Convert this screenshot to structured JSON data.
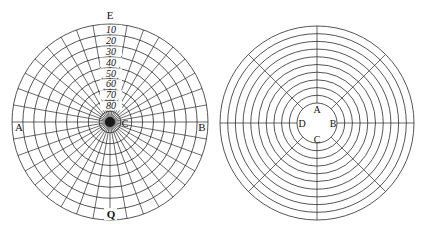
{
  "figures": [
    {
      "id": "polar-grid-left",
      "center": [
        110,
        122
      ],
      "outer_radius": 98,
      "ring_step": 10.9,
      "ring_count": 9,
      "spoke_angle_step_deg": 10,
      "stroke_color": "#2a2a2a",
      "labels": {
        "top": "E",
        "left": "A",
        "right": "B",
        "bottom": "Q",
        "center": "C"
      },
      "degree_labels": [
        "10",
        "20",
        "30",
        "40",
        "50",
        "60",
        "70",
        "80"
      ]
    },
    {
      "id": "ring-grid-right",
      "center": [
        317,
        123
      ],
      "outer_radius": 97,
      "inner_radius": 20,
      "ring_count": 11,
      "spoke_angle_step_deg": 45,
      "stroke_color": "#2a2a2a",
      "labels": {
        "top": "A",
        "right": "B",
        "bottom": "C",
        "left": "D"
      }
    }
  ]
}
